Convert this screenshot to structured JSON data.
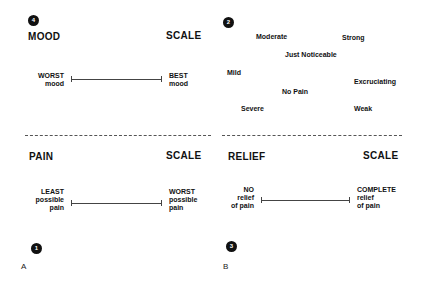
{
  "panel_a": {
    "letter": "A",
    "mood_scale": {
      "badge": "4",
      "title_left": "MOOD",
      "title_right": "SCALE",
      "left_anchor": [
        "WORST",
        "mood"
      ],
      "right_anchor": [
        "BEST",
        "mood"
      ]
    },
    "pain_scale": {
      "badge": "1",
      "title_left": "PAIN",
      "title_right": "SCALE",
      "left_anchor": [
        "LEAST",
        "possible",
        "pain"
      ],
      "right_anchor": [
        "WORST",
        "possible",
        "pain"
      ]
    }
  },
  "panel_b": {
    "letter": "B",
    "word_list": {
      "badge": "2",
      "words": [
        "Moderate",
        "Strong",
        "Just Noticeable",
        "Mild",
        "Excruciating",
        "No Pain",
        "Severe",
        "Weak"
      ]
    },
    "relief_scale": {
      "badge": "3",
      "title_left": "RELIEF",
      "title_right": "SCALE",
      "left_anchor": [
        "NO",
        "relief",
        "of pain"
      ],
      "right_anchor": [
        "COMPLETE",
        "relief",
        "of pain"
      ]
    }
  }
}
